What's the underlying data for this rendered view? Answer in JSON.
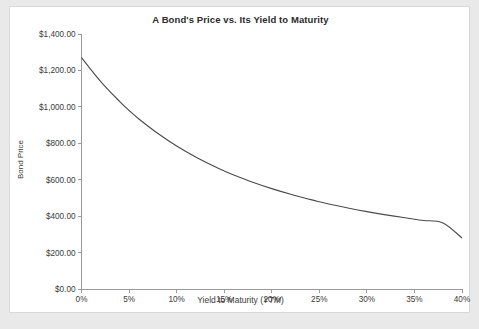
{
  "chart_data": {
    "type": "line",
    "title": "A Bond's Price vs. Its Yield to Maturity",
    "xlabel_plain": "Yield to Maturity (",
    "xlabel_italic": "YTM",
    "xlabel_tail": ")",
    "ylabel": "Bond Price",
    "xlim": [
      0,
      40
    ],
    "ylim": [
      0,
      1400
    ],
    "grid": false,
    "legend": "none",
    "line_color": "#4a4a4a",
    "background_color": "#ffffff",
    "page_background_color": "#e9e9e9",
    "xticks": [
      0,
      5,
      10,
      15,
      20,
      25,
      30,
      35,
      40
    ],
    "xtick_labels": [
      "0%",
      "5%",
      "10%",
      "15%",
      "20%",
      "25%",
      "30%",
      "35%",
      "40%"
    ],
    "yticks": [
      0,
      200,
      400,
      600,
      800,
      1000,
      1200,
      1400
    ],
    "ytick_labels": [
      "$0.00",
      "$200.00",
      "$400.00",
      "$600.00",
      "$800.00",
      "$1,000.00",
      "$1,200.00",
      "$1,400.00"
    ],
    "series": [
      {
        "name": "Bond Price",
        "x": [
          0,
          2,
          4,
          5,
          6,
          8,
          10,
          12,
          14,
          15,
          16,
          18,
          20,
          22,
          24,
          25,
          26,
          28,
          30,
          32,
          34,
          35,
          36,
          38,
          40
        ],
        "values": [
          1270,
          1140,
          1030,
          980,
          935,
          855,
          785,
          725,
          672,
          648,
          626,
          586,
          551,
          520,
          492,
          479,
          467,
          445,
          425,
          407,
          391,
          383,
          376,
          363,
          280
        ]
      }
    ]
  }
}
